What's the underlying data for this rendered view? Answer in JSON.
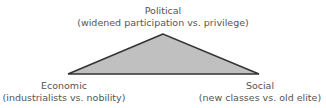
{
  "diagram": {
    "nodes": [
      {
        "id": "political",
        "title": "Political",
        "subtitle": "(widened participation vs. privilege)"
      },
      {
        "id": "economic",
        "title": "Economic",
        "subtitle": "(industrialists vs. nobility)"
      },
      {
        "id": "social",
        "title": "Social",
        "subtitle": "(new classes vs. old elite)"
      }
    ],
    "shape": {
      "type": "triangle",
      "fill": "#c0c0c0",
      "stroke": "#333333"
    }
  }
}
